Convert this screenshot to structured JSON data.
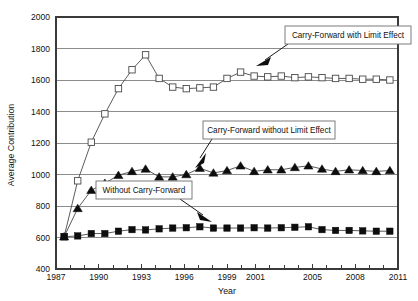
{
  "chart_data": {
    "type": "line",
    "title": "",
    "xlabel": "Year",
    "ylabel": "Average Contribution",
    "xlim": [
      1986.4,
      2011.6
    ],
    "ylim": [
      400,
      2000
    ],
    "grid": true,
    "grid_axis": "y",
    "legend_position": "annotations",
    "y_ticks": [
      400,
      600,
      800,
      1000,
      1200,
      1400,
      1600,
      1800,
      2000
    ],
    "x_ticks": [
      1987,
      1988,
      1989,
      1990,
      1991,
      1992,
      1993,
      1994,
      1995,
      1996,
      1997,
      1998,
      1999,
      2000,
      2001,
      2002,
      2003,
      2004,
      2005,
      2006,
      2007,
      2008,
      2009,
      2010,
      2011
    ],
    "x_tick_labels": [
      "1987",
      "",
      "",
      "1990",
      "",
      "",
      "1993",
      "",
      "",
      "1996",
      "",
      "",
      "1999",
      "",
      "2001",
      "",
      "",
      "",
      "2005",
      "",
      "",
      "2008",
      "",
      "",
      "2011"
    ],
    "x": [
      1987,
      1988,
      1989,
      1990,
      1991,
      1992,
      1993,
      1994,
      1995,
      1996,
      1997,
      1998,
      1999,
      2000,
      2001,
      2002,
      2003,
      2004,
      2005,
      2006,
      2007,
      2008,
      2009,
      2010,
      2011
    ],
    "series": [
      {
        "name": "Carry-Forward with Limit Effect",
        "marker": "open-square",
        "values": [
          605,
          960,
          1205,
          1385,
          1545,
          1665,
          1760,
          1610,
          1555,
          1545,
          1550,
          1555,
          1610,
          1650,
          1625,
          1620,
          1625,
          1615,
          1620,
          1615,
          1610,
          1610,
          1605,
          1605,
          1600
        ]
      },
      {
        "name": "Carry-Forward without Limit Effect",
        "marker": "filled-triangle",
        "values": [
          605,
          785,
          900,
          945,
          995,
          1020,
          1035,
          985,
          985,
          1000,
          1040,
          1010,
          1025,
          1055,
          1020,
          1030,
          1030,
          1045,
          1055,
          1035,
          1020,
          1030,
          1025,
          1020,
          1025
        ]
      },
      {
        "name": "Without Carry-Forward",
        "marker": "filled-square",
        "values": [
          605,
          610,
          625,
          625,
          640,
          650,
          648,
          655,
          660,
          662,
          668,
          660,
          660,
          660,
          662,
          660,
          662,
          665,
          668,
          650,
          645,
          645,
          642,
          640,
          640
        ]
      }
    ],
    "annotations": [
      {
        "text": "Carry-Forward with Limit Effect",
        "target_series": "Carry-Forward with Limit Effect"
      },
      {
        "text": "Carry-Forward without Limit Effect",
        "target_series": "Carry-Forward without Limit Effect"
      },
      {
        "text": "Without Carry-Forward",
        "target_series": "Without Carry-Forward"
      }
    ]
  },
  "colors": {
    "background": "#ffffff",
    "gridline": "#8c8c8c",
    "frame": "#3a3a3a",
    "line": "#4a4a4a",
    "marker_fill": "#0d0d0d",
    "text": "#111111"
  }
}
